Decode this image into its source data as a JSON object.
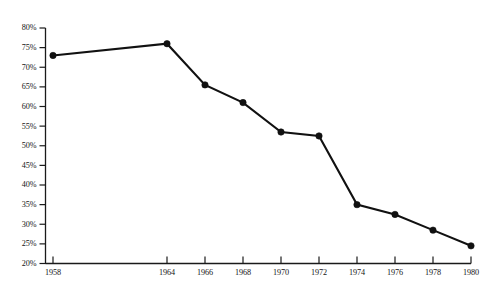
{
  "chart_data": {
    "type": "line",
    "title": "",
    "subtitle": "",
    "xlabel": "",
    "ylabel": "",
    "categories": [
      "1958",
      "1964",
      "1966",
      "1968",
      "1970",
      "1972",
      "1974",
      "1976",
      "1978",
      "1980"
    ],
    "x": [
      1958,
      1964,
      1966,
      1968,
      1970,
      1972,
      1974,
      1976,
      1978,
      1980
    ],
    "values": [
      73,
      76,
      65.5,
      61,
      53.5,
      52.5,
      35,
      32.5,
      28.5,
      24.5
    ],
    "point_labels": [
      "73%",
      "76%",
      "65.5%",
      "61%",
      "53.5%",
      "52.5%",
      "35%",
      "32.5%",
      "28.5%",
      "24.5%"
    ],
    "ylim": [
      20,
      80
    ],
    "xlim": [
      1958,
      1980
    ],
    "ytick_labels": [
      "80%",
      "75%",
      "70%",
      "65%",
      "60%",
      "55%",
      "50%",
      "45%",
      "40%",
      "35%",
      "30%",
      "25%",
      "20%"
    ],
    "ytick_values": [
      80,
      75,
      70,
      65,
      60,
      55,
      50,
      45,
      40,
      35,
      30,
      25,
      20
    ],
    "xtick_labels": [
      "1958",
      "1964",
      "1966",
      "1968",
      "1970",
      "1972",
      "1974",
      "1976",
      "1978",
      "1980"
    ],
    "xtick_values": [
      1958,
      1964,
      1966,
      1968,
      1970,
      1972,
      1974,
      1976,
      1978,
      1980
    ],
    "grid": false,
    "legend": [],
    "legend_position": "none",
    "annotations": [],
    "series": [
      {
        "name": "series-1",
        "values": [
          73,
          76,
          65.5,
          61,
          53.5,
          52.5,
          35,
          32.5,
          28.5,
          24.5
        ],
        "color": "#111111",
        "marker": "circle"
      }
    ],
    "colors": {
      "line": "#111111",
      "marker": "#111111",
      "axis": "#1a1a1a",
      "text": "#151515",
      "background": "#ffffff"
    }
  }
}
